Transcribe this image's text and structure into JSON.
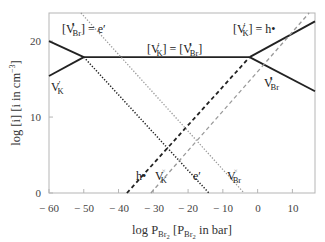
{
  "chart_data": {
    "type": "line",
    "title": "",
    "xlabel": "log P_Br2 [P_Br2 in bar]",
    "ylabel": "log [i] [i in cm^-3]",
    "xlim": [
      -60,
      16.5
    ],
    "ylim": [
      0,
      23.7
    ],
    "grid": false,
    "legend": "none (inline annotations)",
    "x_ticks": [
      -60,
      -50,
      -40,
      -30,
      -20,
      -10,
      0,
      10
    ],
    "x_tick_labels": [
      "− 60",
      "− 50",
      "− 40",
      "− 30",
      "− 20",
      "− 10",
      "0",
      "10"
    ],
    "y_ticks": [
      0,
      10,
      20
    ],
    "y_tick_labels": [
      "0",
      "10",
      "20"
    ],
    "series": [
      {
        "name": "[V•Br] (low P)",
        "style": "solid",
        "color": "#222222",
        "width": 1.8,
        "x": [
          -60,
          -50
        ],
        "y": [
          20.0,
          17.9
        ]
      },
      {
        "name": "V′K (low P)",
        "style": "solid",
        "color": "#222222",
        "width": 1.8,
        "x": [
          -60,
          -50
        ],
        "y": [
          15.4,
          17.9
        ]
      },
      {
        "name": "[V′K] = [V•Br] plateau",
        "style": "solid",
        "color": "#222222",
        "width": 1.8,
        "x": [
          -50,
          -2.3
        ],
        "y": [
          17.9,
          17.9
        ]
      },
      {
        "name": "V′K (high P)",
        "style": "solid",
        "color": "#222222",
        "width": 1.8,
        "x": [
          -2.3,
          16.5
        ],
        "y": [
          17.9,
          22.6
        ]
      },
      {
        "name": "V•Br (high P)",
        "style": "solid",
        "color": "#222222",
        "width": 1.8,
        "x": [
          -2.3,
          16.5
        ],
        "y": [
          17.9,
          13.4
        ]
      },
      {
        "name": "h•",
        "style": "dashed",
        "color": "#222222",
        "width": 1.8,
        "x": [
          -37.6,
          -2.3
        ],
        "y": [
          0,
          17.9
        ]
      },
      {
        "name": "e′",
        "style": "dotted",
        "color": "#222222",
        "width": 1.5,
        "x": [
          -50,
          -14.0
        ],
        "y": [
          17.9,
          0
        ]
      },
      {
        "name": "V×K",
        "style": "dashed",
        "color": "#9a9a9a",
        "width": 1.3,
        "x": [
          -30.7,
          14.8
        ],
        "y": [
          0,
          23.7
        ]
      },
      {
        "name": "V×Br",
        "style": "dotted",
        "color": "#9a9a9a",
        "width": 1.3,
        "x": [
          -50.8,
          -3.9
        ],
        "y": [
          23.7,
          0
        ]
      }
    ],
    "annotations": [
      {
        "id": "vbr_eq_e",
        "text": "[V•Br] = e′",
        "x": -56.5,
        "y": 20.8
      },
      {
        "id": "vk_eq_vbr",
        "text": "[V′K] = [V•Br]",
        "x": -26.5,
        "y": 18.5
      },
      {
        "id": "vk_eq_h",
        "text": "[V′K] = h•",
        "x": -7.5,
        "y": 20.8
      },
      {
        "id": "vk_low",
        "text": "V′K",
        "x": -59.5,
        "y": 13.4
      },
      {
        "id": "vbr_high",
        "text": "V•Br",
        "x": 3.5,
        "y": 14.0
      },
      {
        "id": "h_label",
        "text": "h•",
        "x": -35.5,
        "y": 2.6
      },
      {
        "id": "vkx_label",
        "text": "V×K",
        "x": -29.0,
        "y": 2.6
      },
      {
        "id": "e_label",
        "text": "e′",
        "x": -20.0,
        "y": 2.6
      },
      {
        "id": "vbrx_label",
        "text": "V×Br",
        "x": -10.5,
        "y": 2.6
      }
    ]
  },
  "labels": {
    "ylabel_main": "log [i] [i in cm",
    "ylabel_sup": "−3",
    "ylabel_end": "]",
    "xlabel_main": "log P",
    "xlabel_sub": "Br",
    "xlabel_sub2": "2",
    "xlabel_mid": " [P",
    "xlabel_sub3": "Br",
    "xlabel_sub4": "2",
    "xlabel_end": " in bar]",
    "ann_vbr_eq_e": {
      "a": "[V",
      "b": "•",
      "c": "Br",
      "d": "] = e′"
    },
    "ann_vk_eq_vbr": {
      "a": "[V",
      "b": "′",
      "c": "K",
      "d": "] = [V",
      "e": "•",
      "f": "Br",
      "g": "]"
    },
    "ann_vk_eq_h": {
      "a": "[V",
      "b": "′",
      "c": "K",
      "d": "] = h•"
    },
    "ann_vk_low": {
      "a": "V",
      "b": "′",
      "c": "K"
    },
    "ann_vbr_high": {
      "a": "V",
      "b": "•",
      "c": "Br"
    },
    "ann_h": {
      "a": "h•"
    },
    "ann_vkx": {
      "a": "V",
      "b": "×",
      "c": "K"
    },
    "ann_e": {
      "a": "e′"
    },
    "ann_vbrx": {
      "a": "V",
      "b": "×",
      "c": "Br"
    }
  }
}
